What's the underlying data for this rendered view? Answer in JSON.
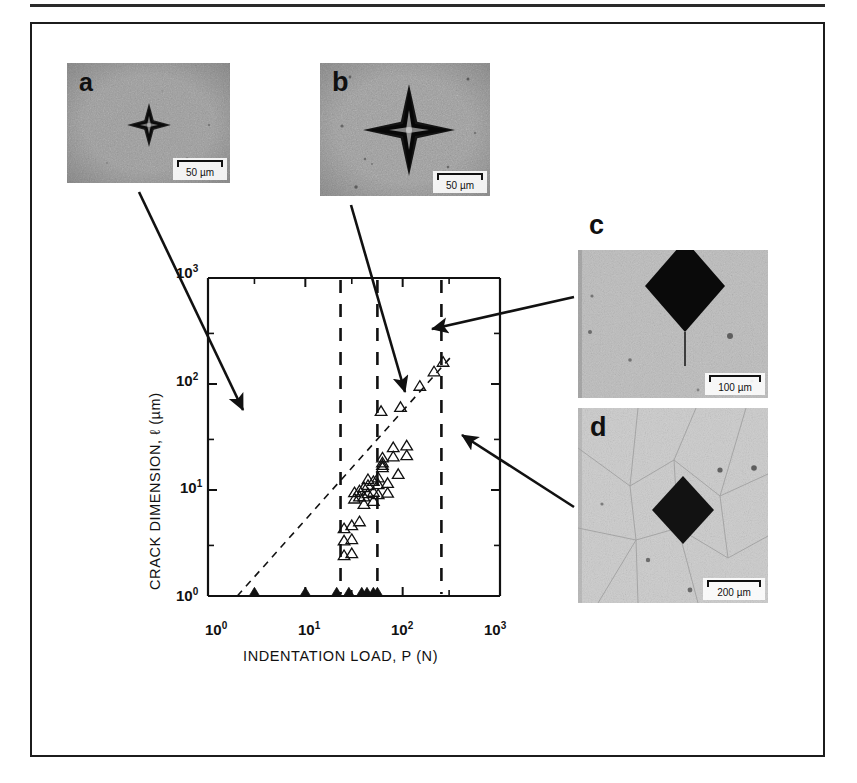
{
  "figure": {
    "kind": "scientific-figure",
    "caption": "",
    "panel_letters": [
      "a",
      "b",
      "c",
      "d"
    ]
  },
  "panels": [
    {
      "id": "a",
      "letter": "a",
      "scale_value": "50",
      "scale_unit": "µm",
      "scale_label": "50 µm",
      "description": "small Vickers indentation with short radial cracks",
      "background": "#9a9a9a"
    },
    {
      "id": "b",
      "letter": "b",
      "scale_value": "50",
      "scale_unit": "µm",
      "scale_label": "50 µm",
      "description": "larger Vickers indentation with radial cracks",
      "background": "#9d9d9d"
    },
    {
      "id": "c",
      "letter": "c",
      "scale_value": "100",
      "scale_unit": "µm",
      "scale_label": "100 µm",
      "description": "large dark indentation with single long radial crack",
      "background": "#b8b8b8"
    },
    {
      "id": "d",
      "letter": "d",
      "scale_value": "200",
      "scale_unit": "µm",
      "scale_label": "200 µm",
      "description": "indentation with surrounding grain boundary network",
      "background": "#c9c9c9"
    }
  ],
  "chart_data": {
    "type": "scatter",
    "title": "",
    "xlabel": "INDENTATION LOAD, P (N)",
    "ylabel": "CRACK DIMENSION, ℓ (µm)",
    "xscale": "log",
    "yscale": "log",
    "xlim": [
      1,
      1000
    ],
    "ylim": [
      1,
      1000
    ],
    "xticklabels": [
      "10⁰",
      "10¹",
      "10²",
      "10³"
    ],
    "yticklabels": [
      "10⁰",
      "10¹",
      "10²",
      "10³"
    ],
    "xtick_values": [
      1,
      10,
      100,
      1000
    ],
    "ytick_values": [
      1,
      10,
      100,
      1000
    ],
    "grid": false,
    "legend": "none",
    "series": [
      {
        "name": "cracked indentations (open triangles)",
        "marker": "open-triangle-up",
        "points": [
          [
            25,
            4.3
          ],
          [
            25,
            3.3
          ],
          [
            25,
            2.4
          ],
          [
            30,
            4.6
          ],
          [
            30,
            3.4
          ],
          [
            30,
            2.5
          ],
          [
            32,
            8.2
          ],
          [
            32,
            9.4
          ],
          [
            36,
            5.0
          ],
          [
            36,
            9.8
          ],
          [
            36,
            8.6
          ],
          [
            40,
            10.5
          ],
          [
            40,
            8.6
          ],
          [
            40,
            7.3
          ],
          [
            44,
            12.5
          ],
          [
            44,
            11.0
          ],
          [
            44,
            9.2
          ],
          [
            50,
            12.0
          ],
          [
            50,
            9.5
          ],
          [
            50,
            7.8
          ],
          [
            56,
            13.0
          ],
          [
            56,
            11.2
          ],
          [
            56,
            9.0
          ],
          [
            60,
            55.0
          ],
          [
            62,
            20.0
          ],
          [
            62,
            18.0
          ],
          [
            62,
            17.0
          ],
          [
            62,
            16.2
          ],
          [
            70,
            11.5
          ],
          [
            70,
            9.3
          ],
          [
            80,
            25.0
          ],
          [
            80,
            20.5
          ],
          [
            90,
            14.0
          ],
          [
            95,
            60.0
          ],
          [
            110,
            26.0
          ],
          [
            110,
            21.0
          ],
          [
            150,
            95.0
          ],
          [
            210,
            130.0
          ],
          [
            260,
            160.0
          ]
        ]
      },
      {
        "name": "no-crack / threshold indentations (filled triangles, plotted on axis)",
        "marker": "filled-triangle-up",
        "points": [
          [
            3,
            1.0
          ],
          [
            10,
            1.0
          ],
          [
            21,
            1.0
          ],
          [
            28,
            1.0
          ],
          [
            38,
            1.0
          ],
          [
            43,
            1.0
          ],
          [
            50,
            1.0
          ],
          [
            55,
            1.0
          ]
        ]
      }
    ],
    "reference_line": {
      "style": "dashed",
      "description": "dashed power-law line, slope 2/3 in log-log",
      "x_start": 2.0,
      "y_start": 1.0,
      "x_end": 330,
      "y_end": 190
    },
    "threshold_lines": {
      "style": "dashed-vertical",
      "x_values": [
        23,
        55,
        250
      ],
      "description": "vertical dashed lines marking load thresholds"
    },
    "annotations": [
      {
        "from_panel": "a",
        "target_x": 5.5,
        "target_y": 11,
        "description": "arrow from micrograph a into low-load region"
      },
      {
        "from_panel": "b",
        "target_x": 33,
        "target_y": 85,
        "description": "arrow from micrograph b into mid-load region"
      },
      {
        "from_panel": "c",
        "target_x": 78,
        "target_y": 330,
        "description": "arrow from micrograph c pointing left into plot"
      },
      {
        "from_panel": "d",
        "target_x": 150,
        "target_y": 45,
        "description": "arrow from micrograph d pointing left into plot"
      }
    ]
  }
}
